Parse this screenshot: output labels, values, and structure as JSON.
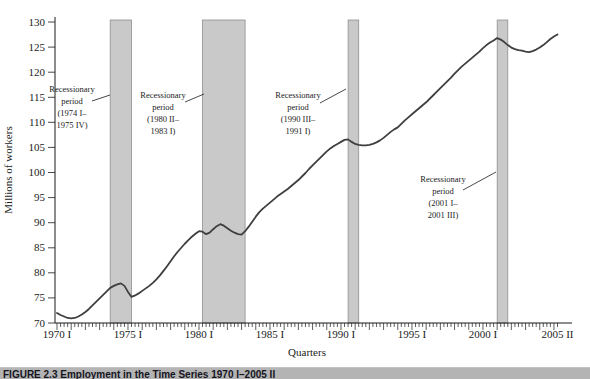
{
  "figure": {
    "caption": "FIGURE 2.3 Employment in the Time Series 1970 I–2005 II"
  },
  "chart_data": {
    "type": "line",
    "title": "",
    "xlabel": "Quarters",
    "ylabel": "Millions of workers",
    "ylim": [
      70,
      130
    ],
    "grid": "off",
    "legend": "none",
    "y_ticks": [
      70,
      75,
      80,
      85,
      90,
      95,
      100,
      105,
      110,
      115,
      120,
      125,
      130
    ],
    "x_range": {
      "start": "1970 I",
      "end": "2005 II",
      "quarters": 141
    },
    "x_tick_labels": [
      {
        "label": "1970 I",
        "q": 0
      },
      {
        "label": "1975 I",
        "q": 20
      },
      {
        "label": "1980 I",
        "q": 40
      },
      {
        "label": "1985 I",
        "q": 60
      },
      {
        "label": "1990 I",
        "q": 80
      },
      {
        "label": "1995 I",
        "q": 100
      },
      {
        "label": "2000 I",
        "q": 120
      },
      {
        "label": "2005 II",
        "q": 141
      }
    ],
    "series": [
      {
        "name": "Employment (millions of workers)",
        "start_quarter": "1970 I",
        "values": [
          72.0,
          71.6,
          71.3,
          71.0,
          70.9,
          71.0,
          71.3,
          71.7,
          72.2,
          72.8,
          73.5,
          74.2,
          74.9,
          75.6,
          76.3,
          77.0,
          77.4,
          77.7,
          77.9,
          77.4,
          76.2,
          75.2,
          75.5,
          75.9,
          76.4,
          76.9,
          77.4,
          78.0,
          78.7,
          79.5,
          80.4,
          81.3,
          82.3,
          83.3,
          84.2,
          85.0,
          85.8,
          86.5,
          87.2,
          87.8,
          88.3,
          88.2,
          87.7,
          88.0,
          88.7,
          89.3,
          89.7,
          89.4,
          88.9,
          88.4,
          88.0,
          87.7,
          87.6,
          88.3,
          89.2,
          90.2,
          91.2,
          92.1,
          92.8,
          93.4,
          94.0,
          94.6,
          95.2,
          95.7,
          96.2,
          96.7,
          97.3,
          97.9,
          98.5,
          99.2,
          99.9,
          100.7,
          101.4,
          102.1,
          102.8,
          103.5,
          104.2,
          104.8,
          105.3,
          105.7,
          106.1,
          106.5,
          106.6,
          106.1,
          105.7,
          105.5,
          105.4,
          105.4,
          105.5,
          105.7,
          106.0,
          106.4,
          106.9,
          107.5,
          108.1,
          108.6,
          109.0,
          109.7,
          110.4,
          111.0,
          111.6,
          112.2,
          112.8,
          113.4,
          114.0,
          114.7,
          115.4,
          116.1,
          116.8,
          117.5,
          118.2,
          118.9,
          119.7,
          120.4,
          121.1,
          121.7,
          122.3,
          122.9,
          123.5,
          124.1,
          124.8,
          125.4,
          125.9,
          126.3,
          126.8,
          126.5,
          126.0,
          125.4,
          124.9,
          124.6,
          124.4,
          124.3,
          124.1,
          124.0,
          124.2,
          124.5,
          124.9,
          125.4,
          126.0,
          126.6,
          127.1,
          127.5
        ]
      }
    ],
    "recession_bands": [
      {
        "from_q": 15,
        "to_q": 21,
        "label_lines": [
          "Recessionary",
          "period",
          "(1974 I–",
          "1975 IV)"
        ],
        "label_cx": 72,
        "label_top": 84,
        "leader": [
          92,
          101,
          110,
          95
        ]
      },
      {
        "from_q": 41,
        "to_q": 53,
        "label_lines": [
          "Recessionary",
          "period",
          "(1980 II–",
          "1983 I)"
        ],
        "label_cx": 163,
        "label_top": 90,
        "leader": [
          185,
          102,
          204,
          94
        ]
      },
      {
        "from_q": 82,
        "to_q": 85,
        "label_lines": [
          "Recessionary",
          "period",
          "(1990 III–",
          "1991 I)"
        ],
        "label_cx": 298,
        "label_top": 90,
        "leader": [
          320,
          103,
          346,
          89
        ]
      },
      {
        "from_q": 124,
        "to_q": 127,
        "label_lines": [
          "Recessionary",
          "period",
          "(2001 I–",
          "2001 III)"
        ],
        "label_cx": 443,
        "label_top": 174,
        "leader": [
          463,
          190,
          496,
          172
        ]
      }
    ],
    "colors": {
      "line": "#3f3f3f",
      "band_fill": "#c9c9c9",
      "band_stroke": "#8f8f8f",
      "axis": "#1a1a1a",
      "caption_bar_bg": "#b4b4b4",
      "caption_text": "#15151f"
    }
  }
}
